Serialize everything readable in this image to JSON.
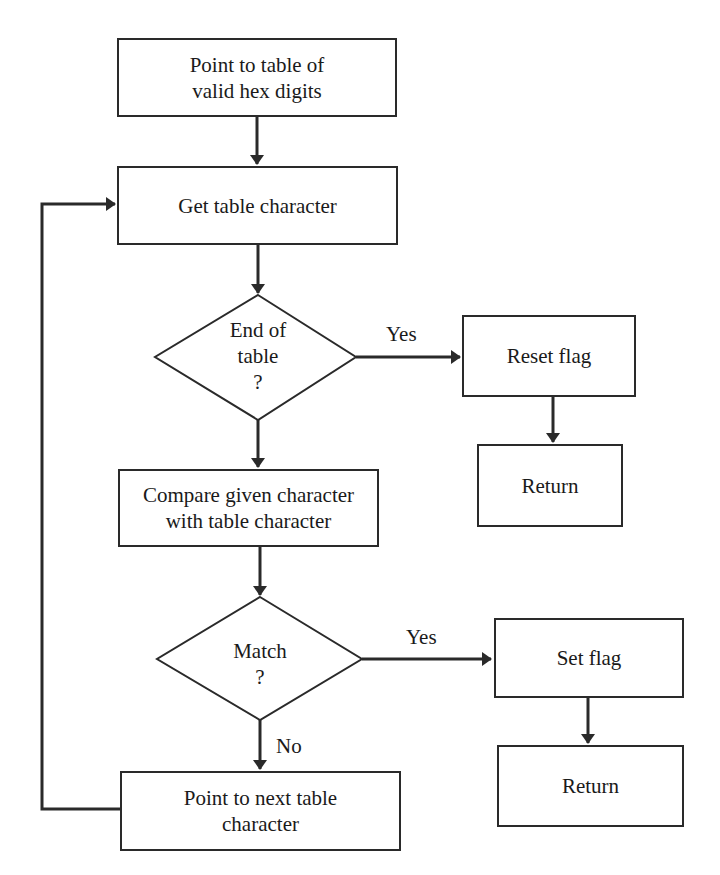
{
  "flowchart": {
    "nodes": {
      "start": {
        "type": "process",
        "line1": "Point to table of",
        "line2": "valid hex digits"
      },
      "get_char": {
        "type": "process",
        "text": "Get table character"
      },
      "end_of_table": {
        "type": "decision",
        "line1": "End of",
        "line2": "table",
        "line3": "?"
      },
      "reset_flag": {
        "type": "process",
        "text": "Reset flag"
      },
      "return_1": {
        "type": "terminal",
        "text": "Return"
      },
      "compare": {
        "type": "process",
        "line1": "Compare given character",
        "line2": "with table character"
      },
      "match": {
        "type": "decision",
        "line1": "Match",
        "line2": "?"
      },
      "set_flag": {
        "type": "process",
        "text": "Set flag"
      },
      "return_2": {
        "type": "terminal",
        "text": "Return"
      },
      "next_char": {
        "type": "process",
        "line1": "Point to next table",
        "line2": "character"
      }
    },
    "edge_labels": {
      "end_yes": "Yes",
      "match_yes": "Yes",
      "match_no": "No"
    },
    "edges": [
      {
        "from": "start",
        "to": "get_char"
      },
      {
        "from": "get_char",
        "to": "end_of_table"
      },
      {
        "from": "end_of_table",
        "to": "reset_flag",
        "label": "Yes"
      },
      {
        "from": "reset_flag",
        "to": "return_1"
      },
      {
        "from": "end_of_table",
        "to": "compare"
      },
      {
        "from": "compare",
        "to": "match"
      },
      {
        "from": "match",
        "to": "set_flag",
        "label": "Yes"
      },
      {
        "from": "set_flag",
        "to": "return_2"
      },
      {
        "from": "match",
        "to": "next_char",
        "label": "No"
      },
      {
        "from": "next_char",
        "to": "get_char"
      }
    ]
  },
  "colors": {
    "line": "#2a2a2a",
    "background": "#ffffff"
  }
}
